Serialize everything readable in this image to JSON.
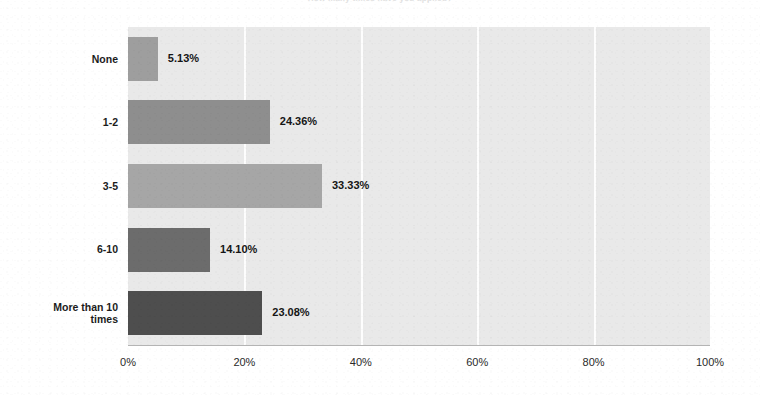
{
  "chart_data": {
    "type": "bar",
    "orientation": "horizontal",
    "title": "How many times have you applied?",
    "categories": [
      "None",
      "1-2",
      "3-5",
      "6-10",
      "More than 10\ntimes"
    ],
    "values": [
      5.13,
      24.36,
      33.33,
      14.1,
      23.08
    ],
    "value_labels": [
      "5.13%",
      "24.36%",
      "33.33%",
      "14.10%",
      "23.08%"
    ],
    "bar_colors": [
      "#9e9e9e",
      "#8e8e8e",
      "#a6a6a6",
      "#6c6c6c",
      "#4e4e4e"
    ],
    "xlabel": "",
    "ylabel": "",
    "xlim": [
      0,
      100
    ],
    "xticks": [
      0,
      20,
      40,
      60,
      80,
      100
    ],
    "xtick_labels": [
      "0%",
      "20%",
      "40%",
      "60%",
      "80%",
      "100%"
    ],
    "grid": true,
    "grid_axis": "x",
    "grid_color": "#ffffff",
    "plot_background": "#e9e9e9",
    "figure_background": "#ffffff",
    "legend": null
  }
}
